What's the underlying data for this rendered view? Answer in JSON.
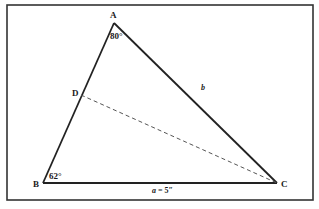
{
  "diagram": {
    "type": "triangle",
    "frame": {
      "x": 7,
      "y": 5,
      "width": 306,
      "height": 195,
      "stroke": "#333333"
    },
    "vertices": {
      "A": {
        "label": "A",
        "x": 114,
        "y": 23
      },
      "B": {
        "label": "B",
        "x": 43,
        "y": 183
      },
      "C": {
        "label": "C",
        "x": 277,
        "y": 183
      },
      "D": {
        "label": "D",
        "x": 81,
        "y": 95
      }
    },
    "angles": {
      "A": {
        "label": "80°",
        "value": 80
      },
      "B": {
        "label": "62°",
        "value": 62
      }
    },
    "sides": {
      "a": {
        "label_var": "a",
        "label_rest": " = 5″",
        "between": "B-C"
      },
      "b": {
        "label": "b",
        "between": "A-C"
      }
    },
    "segments": [
      {
        "from": "A",
        "to": "B",
        "style": "solid"
      },
      {
        "from": "A",
        "to": "C",
        "style": "solid"
      },
      {
        "from": "B",
        "to": "C",
        "style": "solid"
      },
      {
        "from": "D",
        "to": "C",
        "style": "dashed"
      }
    ],
    "colors": {
      "line": "#222222",
      "dashed": "#555555",
      "text": "#1a1a1a"
    }
  }
}
